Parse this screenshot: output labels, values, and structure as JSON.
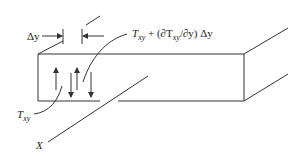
{
  "diagram": {
    "labels": {
      "delta_y": "Δy",
      "shear_top_T": "T",
      "shear_top_sub": "xy",
      "shear_top_rest": " + (∂T",
      "shear_top_sub2": "xy",
      "shear_top_rest2": "/∂y) Δy",
      "shear_bottom_T": "T",
      "shear_bottom_sub": "xy",
      "axis_x": "X"
    },
    "colors": {
      "line": "#333333",
      "text": "#222222",
      "background": "#ffffff"
    }
  }
}
